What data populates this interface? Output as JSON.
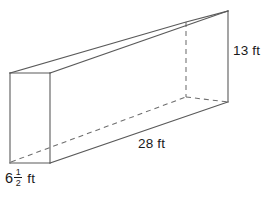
{
  "figure": {
    "name": "rectangular-prism-diagram",
    "shape_type": "rectangular prism",
    "projection": "oblique",
    "background_color": "#ffffff",
    "solid_edge_color": "#5a5a5a",
    "hidden_edge_color": "#6e6e6e",
    "label_color": "#1a1a1a"
  },
  "labels": {
    "height": {
      "text": "13 ft",
      "value": 13,
      "unit": "ft",
      "dimension": "height"
    },
    "length": {
      "text": "28 ft",
      "value": 28,
      "unit": "ft",
      "dimension": "length"
    },
    "depth": {
      "whole": "6",
      "numerator": "1",
      "denominator": "2",
      "unit": "ft",
      "text": "6 1/2 ft",
      "value": 6.5,
      "dimension": "depth"
    }
  },
  "watermark": {
    "top_text": "",
    "bottom_text": ""
  }
}
